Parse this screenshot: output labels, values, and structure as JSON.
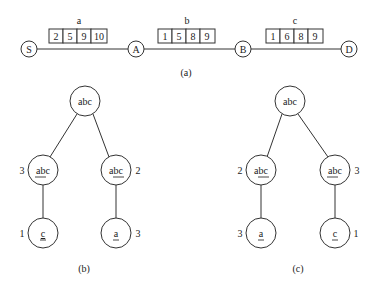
{
  "panel_a": {
    "caption": "(a)",
    "nodes": [
      {
        "id": "S",
        "label": "S"
      },
      {
        "id": "A",
        "label": "A"
      },
      {
        "id": "B",
        "label": "B"
      },
      {
        "id": "D",
        "label": "D"
      }
    ],
    "edges": [
      {
        "name": "a",
        "label": "a",
        "from": "S",
        "to": "A",
        "values": [
          "2",
          "5",
          "9",
          "10"
        ]
      },
      {
        "name": "b",
        "label": "b",
        "from": "A",
        "to": "B",
        "values": [
          "1",
          "5",
          "8",
          "9"
        ]
      },
      {
        "name": "c",
        "label": "c",
        "from": "B",
        "to": "D",
        "values": [
          "1",
          "6",
          "8",
          "9"
        ]
      }
    ]
  },
  "panel_b": {
    "caption": "(b)",
    "root": {
      "label": "abc"
    },
    "left": {
      "label": "abc",
      "underlined": "ab",
      "rest": "c",
      "weight": "3"
    },
    "right": {
      "label": "abc",
      "prefix": "a",
      "underlined": "bc",
      "weight": "2"
    },
    "left_child": {
      "label": "c",
      "underlined": "c",
      "weight": "1"
    },
    "right_child": {
      "label": "a",
      "underlined": "a",
      "weight": "3"
    }
  },
  "panel_c": {
    "caption": "(c)",
    "root": {
      "label": "abc"
    },
    "left": {
      "label": "abc",
      "prefix": "a",
      "underlined": "bc",
      "weight": "2"
    },
    "right": {
      "label": "abc",
      "underlined": "ab",
      "rest": "c",
      "weight": "3"
    },
    "left_child": {
      "label": "a",
      "underlined": "a",
      "weight": "3"
    },
    "right_child": {
      "label": "c",
      "underlined": "c",
      "weight": "1"
    }
  }
}
